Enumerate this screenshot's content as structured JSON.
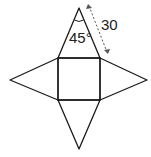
{
  "diagram": {
    "type": "pyramid-net",
    "labels": {
      "angle": "45°",
      "slant_edge": "30"
    },
    "stroke_color": "#1a1a1a",
    "dim_color": "#555555"
  }
}
